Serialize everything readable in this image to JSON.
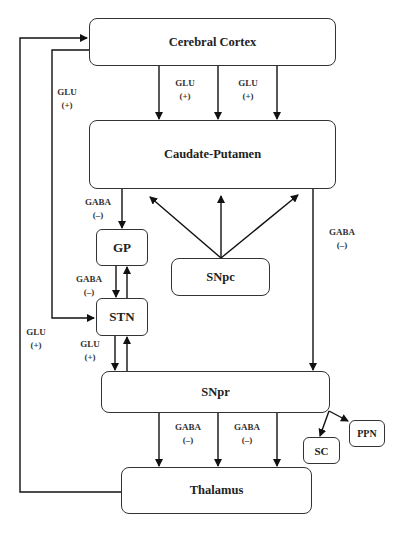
{
  "diagram": {
    "type": "basal-ganglia-circuit",
    "line_color": "#111111",
    "nodes": {
      "cortex": {
        "label": "Cerebral Cortex"
      },
      "caudate": {
        "label": "Caudate-Putamen"
      },
      "gp": {
        "label": "GP"
      },
      "snpc": {
        "label": "SNpc"
      },
      "stn": {
        "label": "STN"
      },
      "snpr": {
        "label": "SNpr"
      },
      "ppn": {
        "label": "PPN"
      },
      "sc": {
        "label": "SC"
      },
      "thalamus": {
        "label": "Thalamus"
      }
    },
    "labels": {
      "cortex_caudate_1": {
        "transmitter": "GLU",
        "sign": "(+)"
      },
      "cortex_caudate_2": {
        "transmitter": "GLU",
        "sign": "(+)"
      },
      "cortex_stn": {
        "transmitter": "GLU",
        "sign": "(+)"
      },
      "caudate_gp": {
        "transmitter": "GABA",
        "sign": "(–)"
      },
      "caudate_snpr": {
        "transmitter": "GABA",
        "sign": "(–)"
      },
      "gp_stn": {
        "transmitter": "GABA",
        "sign": "(–)"
      },
      "thalamus_cortex": {
        "transmitter": "GLU",
        "sign": "(+)"
      },
      "stn_snpr": {
        "transmitter": "GLU",
        "sign": "(+)"
      },
      "snpr_thalamus_1": {
        "transmitter": "GABA",
        "sign": "(–)"
      },
      "snpr_thalamus_2": {
        "transmitter": "GABA",
        "sign": "(–)"
      }
    },
    "edges": [
      {
        "from": "Cerebral Cortex",
        "to": "Caudate-Putamen",
        "label": "GLU (+)"
      },
      {
        "from": "Cerebral Cortex",
        "to": "STN",
        "label": "GLU (+)"
      },
      {
        "from": "Caudate-Putamen",
        "to": "GP",
        "label": "GABA (–)"
      },
      {
        "from": "Caudate-Putamen",
        "to": "SNpr",
        "label": "GABA (–)"
      },
      {
        "from": "SNpc",
        "to": "Caudate-Putamen",
        "label": ""
      },
      {
        "from": "GP",
        "to": "STN",
        "label": "GABA (–)"
      },
      {
        "from": "STN",
        "to": "GP",
        "label": ""
      },
      {
        "from": "STN",
        "to": "SNpr",
        "label": "GLU (+)"
      },
      {
        "from": "SNpr",
        "to": "STN",
        "label": ""
      },
      {
        "from": "SNpr",
        "to": "Thalamus",
        "label": "GABA (–)"
      },
      {
        "from": "SNpr",
        "to": "SC",
        "label": ""
      },
      {
        "from": "SNpr",
        "to": "PPN",
        "label": ""
      },
      {
        "from": "Thalamus",
        "to": "Cerebral Cortex",
        "label": "GLU (+)"
      }
    ]
  }
}
